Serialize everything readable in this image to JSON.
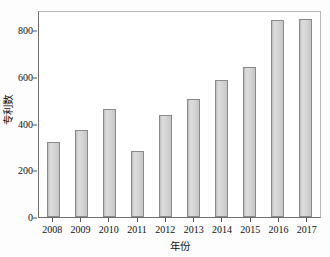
{
  "chart_data": {
    "type": "bar",
    "title": "",
    "subtitle": "",
    "xlabel": "年份",
    "ylabel": "专利数",
    "categories": [
      "2008",
      "2009",
      "2010",
      "2011",
      "2012",
      "2013",
      "2014",
      "2015",
      "2016",
      "2017"
    ],
    "values": [
      320,
      375,
      462,
      285,
      436,
      505,
      588,
      645,
      846,
      852
    ],
    "series": [
      {
        "name": "专利数",
        "values": [
          320,
          375,
          462,
          285,
          436,
          505,
          588,
          645,
          846,
          852
        ]
      }
    ],
    "ylim": [
      0,
      880
    ],
    "xlim_categories": 10,
    "yticks": [
      0,
      200,
      400,
      600,
      800
    ],
    "ytick_labels": [
      "0",
      "200",
      "400",
      "600",
      "800"
    ],
    "xtick_labels": [
      "2008",
      "2009",
      "2010",
      "2011",
      "2012",
      "2013",
      "2014",
      "2015",
      "2016",
      "2017"
    ],
    "grid": false,
    "legend": null,
    "legend_position": "none",
    "annotations": [],
    "colors": {
      "bar_fill": "#d2d2d2",
      "bar_edge": "#8a8a8a",
      "axis": "#6e6e6e",
      "frame_light": "#b9b9b9",
      "text": "#111111",
      "background": "#ffffff"
    }
  }
}
